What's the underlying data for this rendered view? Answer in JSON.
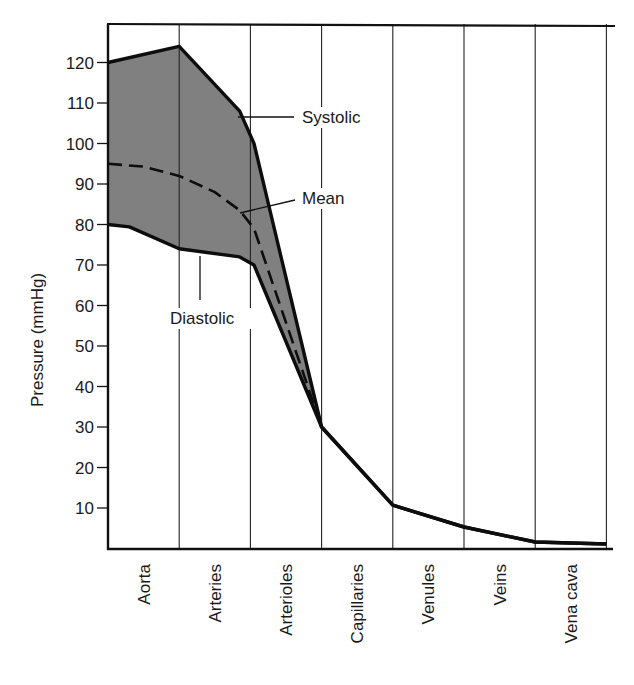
{
  "chart_data": {
    "type": "line",
    "title": "",
    "xlabel": "",
    "ylabel": "Pressure (mmHg)",
    "ylim": [
      0,
      130
    ],
    "yticks": [
      10,
      20,
      30,
      40,
      50,
      60,
      70,
      80,
      90,
      100,
      110,
      120
    ],
    "categories": [
      "Aorta",
      "Arteries",
      "Arterioles",
      "Capillaries",
      "Venules",
      "Veins",
      "Vena cava"
    ],
    "grid": "vertical lines separating vessel segments",
    "fill_between": {
      "upper": "Systolic",
      "lower": "Diastolic",
      "color": "#808080"
    },
    "boundaries_x": [
      0,
      1,
      2,
      3,
      4,
      5,
      6,
      7
    ],
    "series": [
      {
        "name": "Systolic",
        "style": "solid",
        "points": [
          [
            0,
            120
          ],
          [
            1,
            124
          ],
          [
            1.85,
            108
          ],
          [
            2.05,
            100
          ],
          [
            3,
            30
          ],
          [
            4,
            10.7
          ],
          [
            5,
            5.3
          ],
          [
            6,
            1.6
          ],
          [
            7,
            1.1
          ]
        ]
      },
      {
        "name": "Mean",
        "style": "dashed",
        "points": [
          [
            0,
            95
          ],
          [
            0.5,
            94.3
          ],
          [
            1,
            92
          ],
          [
            1.5,
            88
          ],
          [
            1.85,
            83.5
          ],
          [
            2.05,
            79
          ],
          [
            3,
            30
          ]
        ]
      },
      {
        "name": "Diastolic",
        "style": "solid",
        "points": [
          [
            0,
            80
          ],
          [
            0.3,
            79.4
          ],
          [
            1,
            74
          ],
          [
            1.85,
            72
          ],
          [
            2.05,
            70
          ],
          [
            3,
            30
          ],
          [
            4,
            10.7
          ],
          [
            5,
            5.3
          ],
          [
            6,
            1.6
          ],
          [
            7,
            1.1
          ]
        ]
      }
    ],
    "annotations": [
      {
        "text": "Systolic",
        "x": 302,
        "y": 123,
        "leader": [
          [
            238,
            117
          ],
          [
            294,
            117
          ]
        ]
      },
      {
        "text": "Mean",
        "x": 302,
        "y": 204,
        "leader": [
          [
            240,
            213
          ],
          [
            295,
            200
          ]
        ]
      },
      {
        "text": "Diastolic",
        "x": 170,
        "y": 324,
        "leader": [
          [
            200,
            256
          ],
          [
            200,
            300
          ]
        ]
      }
    ]
  }
}
